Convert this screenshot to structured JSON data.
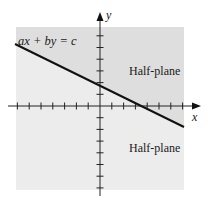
{
  "diagram": {
    "equation_label": "ax + by = c",
    "x_axis_label": "x",
    "y_axis_label": "y",
    "upper_region_label": "Half-plane",
    "lower_region_label": "Half-plane",
    "colors": {
      "upper_region": "#dedede",
      "lower_region": "#ececec",
      "line": "#111111",
      "axes": "#222222"
    },
    "x_ticks_left": 7,
    "x_ticks_right": 7,
    "y_ticks_up": 6,
    "y_ticks_down": 7
  }
}
